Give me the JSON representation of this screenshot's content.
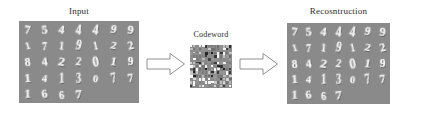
{
  "figure": {
    "title_left": "Input",
    "title_middle": "Codeword",
    "title_right": "Recosntruction",
    "background_color": "#ffffff",
    "panel_background_color": "#8a8a8a",
    "digit_color": "#f2f2f2",
    "arrow_outline_color": "#8f8f8f",
    "arrow_fill_color": "#ffffff"
  },
  "arrows": [
    {
      "name": "encode-arrow",
      "direction": "right"
    },
    {
      "name": "decode-arrow",
      "direction": "right"
    }
  ],
  "input_panel": {
    "label": "Input",
    "columns": 7,
    "rows": 5,
    "digits": [
      [
        "7",
        "5",
        "4",
        "4",
        "4",
        "9",
        "9"
      ],
      [
        "1",
        "7",
        "1",
        "9",
        "1",
        "2",
        "2"
      ],
      [
        "8",
        "4",
        "2",
        "2",
        "0",
        "1",
        "9"
      ],
      [
        "1",
        "4",
        "1",
        "3",
        "0",
        "7",
        "7"
      ],
      [
        "1",
        "6",
        "6",
        "7",
        "",
        "",
        ""
      ]
    ]
  },
  "codeword_panel": {
    "label": "Codeword",
    "description": "sparse binary code map",
    "columns": 14,
    "rows": 13
  },
  "reconstruction_panel": {
    "label": "Recosntruction",
    "columns": 7,
    "rows": 5,
    "digits": [
      [
        "7",
        "5",
        "4",
        "4",
        "4",
        "9",
        "9"
      ],
      [
        "1",
        "7",
        "1",
        "9",
        "1",
        "2",
        "2"
      ],
      [
        "8",
        "4",
        "2",
        "2",
        "0",
        "1",
        "9"
      ],
      [
        "1",
        "4",
        "1",
        "3",
        "0",
        "7",
        "7"
      ],
      [
        "1",
        "6",
        "6",
        "7",
        "",
        "",
        ""
      ]
    ]
  }
}
